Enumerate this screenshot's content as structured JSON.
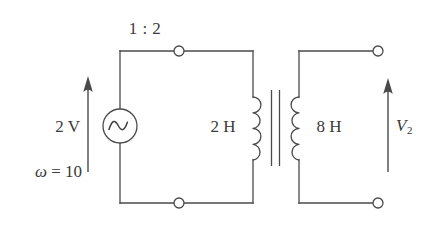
{
  "figure": {
    "name": "ac-transformer-circuit",
    "background_color": "#ffffff",
    "line_color": "#4a4a4a",
    "text_color": "#3a3a3a"
  },
  "labels": {
    "turns_ratio": "1 : 2",
    "source_voltage": "2 V",
    "omega_symbol": "ω",
    "omega_equals": " = 10",
    "omega_full": "ω = 10",
    "primary_inductance": "2 H",
    "secondary_inductance": "8 H",
    "output_voltage_symbol": "V",
    "output_voltage_subscript": "2",
    "output_voltage_full": "V₂"
  },
  "components": {
    "source": {
      "type": "ac-voltage-source",
      "symbol": "sine-wave",
      "value": "2 V",
      "frequency": "ω = 10"
    },
    "transformer": {
      "type": "ideal-transformer",
      "ratio": "1 : 2",
      "primary": "2 H",
      "secondary": "8 H",
      "core_lines": 2,
      "primary_turns_drawn": 4,
      "secondary_turns_drawn": 4
    },
    "terminals": [
      {
        "name": "primary-top-terminal",
        "style": "open-circle"
      },
      {
        "name": "primary-bottom-terminal",
        "style": "open-circle"
      },
      {
        "name": "secondary-top-terminal",
        "style": "open-circle"
      },
      {
        "name": "secondary-bottom-terminal",
        "style": "open-circle"
      }
    ],
    "arrows": [
      {
        "name": "input-voltage-arrow",
        "direction": "up",
        "label": "2 V"
      },
      {
        "name": "output-voltage-arrow",
        "direction": "up",
        "label": "V₂"
      }
    ]
  }
}
